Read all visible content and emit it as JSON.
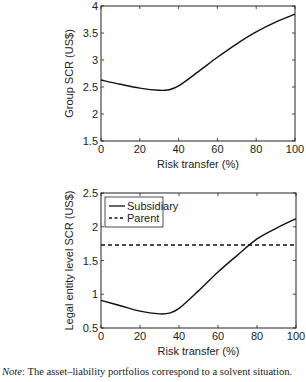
{
  "chart_data": [
    {
      "type": "line",
      "title": "",
      "xlabel": "Risk transfer (%)",
      "ylabel": "Group SCR (US$)",
      "xlim": [
        0,
        100
      ],
      "ylim": [
        1.5,
        4
      ],
      "xticks": [
        0,
        20,
        40,
        60,
        80,
        100
      ],
      "yticks": [
        1.5,
        2,
        2.5,
        3,
        3.5,
        4
      ],
      "xtick_labels": [
        "0",
        "20",
        "40",
        "60",
        "80",
        "100"
      ],
      "ytick_labels": [
        "1.5",
        "2",
        "2.5",
        "3",
        "3.5",
        "4"
      ],
      "grid": false,
      "legend": null,
      "series": [
        {
          "name": "Group",
          "style": "solid",
          "x": [
            0,
            10,
            20,
            30,
            35,
            40,
            50,
            60,
            70,
            80,
            90,
            100
          ],
          "y": [
            2.63,
            2.55,
            2.48,
            2.44,
            2.45,
            2.52,
            2.78,
            3.05,
            3.3,
            3.52,
            3.7,
            3.85
          ]
        }
      ]
    },
    {
      "type": "line",
      "title": "",
      "xlabel": "Risk transfer (%)",
      "ylabel": "Legal entity level SCR (US$)",
      "xlim": [
        0,
        100
      ],
      "ylim": [
        0.5,
        2.5
      ],
      "xticks": [
        0,
        20,
        40,
        60,
        80,
        100
      ],
      "yticks": [
        0.5,
        1,
        1.5,
        2,
        2.5
      ],
      "xtick_labels": [
        "0",
        "20",
        "40",
        "60",
        "80",
        "100"
      ],
      "ytick_labels": [
        "0.5",
        "1",
        "1.5",
        "2",
        "2.5"
      ],
      "grid": false,
      "legend": {
        "position": "upper left",
        "entries": [
          "Subsidiary",
          "Parent"
        ]
      },
      "series": [
        {
          "name": "Subsidiary",
          "style": "solid",
          "x": [
            0,
            10,
            20,
            30,
            35,
            40,
            50,
            60,
            70,
            80,
            90,
            100
          ],
          "y": [
            0.91,
            0.83,
            0.75,
            0.71,
            0.72,
            0.79,
            1.05,
            1.33,
            1.58,
            1.82,
            1.98,
            2.12
          ]
        },
        {
          "name": "Parent",
          "style": "dashed",
          "x": [
            0,
            100
          ],
          "y": [
            1.73,
            1.73
          ]
        }
      ]
    }
  ],
  "note": {
    "label": "Note",
    "text": ": The asset–liability portfolios correspond to a solvent situation."
  }
}
